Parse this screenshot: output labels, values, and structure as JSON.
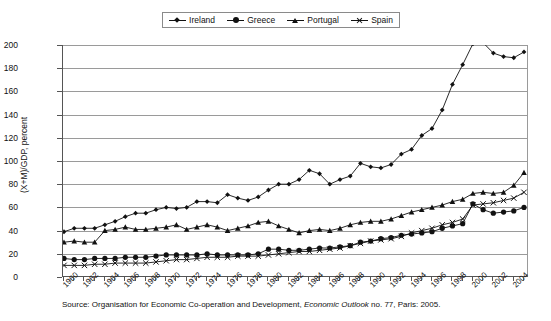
{
  "chart_data": {
    "type": "line",
    "title": "",
    "xlabel": "",
    "ylabel": "(X+M)/GDP, percent",
    "ylim": [
      0,
      200
    ],
    "ytick_values": [
      0,
      20,
      40,
      60,
      80,
      100,
      120,
      140,
      160,
      180,
      200
    ],
    "xlim": [
      1960,
      2005
    ],
    "xtick_labels": [
      "1960",
      "1962",
      "1964",
      "1966",
      "1968",
      "1970",
      "1972",
      "1974",
      "1976",
      "1978",
      "1980",
      "1982",
      "1984",
      "1986",
      "1988",
      "1990",
      "1992",
      "1994",
      "1996",
      "1998",
      "2000",
      "2002",
      "2004"
    ],
    "grid": "horizontal",
    "legend_position": "top-center",
    "x": [
      1960,
      1961,
      1962,
      1963,
      1964,
      1965,
      1966,
      1967,
      1968,
      1969,
      1970,
      1971,
      1972,
      1973,
      1974,
      1975,
      1976,
      1977,
      1978,
      1979,
      1980,
      1981,
      1982,
      1983,
      1984,
      1985,
      1986,
      1987,
      1988,
      1989,
      1990,
      1991,
      1992,
      1993,
      1994,
      1995,
      1996,
      1997,
      1998,
      1999,
      2000,
      2001,
      2002,
      2003,
      2004,
      2005
    ],
    "series": [
      {
        "name": "Ireland",
        "marker": "diamond",
        "values": [
          39,
          42,
          42,
          42,
          45,
          48,
          52,
          55,
          55,
          58,
          60,
          59,
          60,
          65,
          65,
          64,
          71,
          68,
          66,
          69,
          75,
          80,
          80,
          84,
          92,
          89,
          80,
          84,
          87,
          98,
          95,
          94,
          97,
          106,
          110,
          122,
          128,
          144,
          166,
          183,
          201,
          202,
          193,
          190,
          189,
          194
        ]
      },
      {
        "name": "Greece",
        "marker": "circle",
        "values": [
          16,
          15,
          15,
          16,
          16,
          16,
          17,
          17,
          17,
          18,
          19,
          19,
          19,
          19,
          20,
          19,
          19,
          19,
          19,
          20,
          24,
          24,
          23,
          23,
          24,
          25,
          25,
          26,
          27,
          30,
          31,
          33,
          34,
          36,
          37,
          38,
          39,
          42,
          44,
          46,
          63,
          58,
          55,
          56,
          57,
          60
        ]
      },
      {
        "name": "Portugal",
        "marker": "triangle",
        "values": [
          30,
          31,
          30,
          30,
          40,
          41,
          43,
          41,
          41,
          42,
          43,
          45,
          41,
          43,
          45,
          43,
          40,
          42,
          44,
          47,
          48,
          44,
          41,
          38,
          40,
          41,
          40,
          42,
          45,
          47,
          48,
          48,
          50,
          53,
          56,
          58,
          60,
          62,
          65,
          67,
          72,
          73,
          72,
          73,
          79,
          90
        ]
      },
      {
        "name": "Spain",
        "marker": "x",
        "values": [
          10,
          10,
          10,
          11,
          11,
          12,
          12,
          12,
          12,
          13,
          14,
          15,
          15,
          16,
          17,
          17,
          17,
          18,
          18,
          18,
          19,
          20,
          21,
          22,
          22,
          23,
          24,
          25,
          27,
          29,
          31,
          32,
          33,
          35,
          38,
          40,
          42,
          45,
          47,
          50,
          62,
          63,
          64,
          66,
          68,
          73
        ]
      }
    ]
  },
  "legend": {
    "items": [
      {
        "label": "Ireland",
        "marker": "diamond-icon"
      },
      {
        "label": "Greece",
        "marker": "circle-icon"
      },
      {
        "label": "Portugal",
        "marker": "triangle-icon"
      },
      {
        "label": "Spain",
        "marker": "x-icon"
      }
    ]
  },
  "source": {
    "prefix": "Source: Organisation for Economic Co-operation and Development, ",
    "italic": "Economic Outlook",
    "suffix": " no. 77, Paris: 2005."
  },
  "colors": {
    "series": "#111111",
    "grid": "#9a9a9a",
    "axis": "#555555",
    "background": "#ffffff"
  }
}
